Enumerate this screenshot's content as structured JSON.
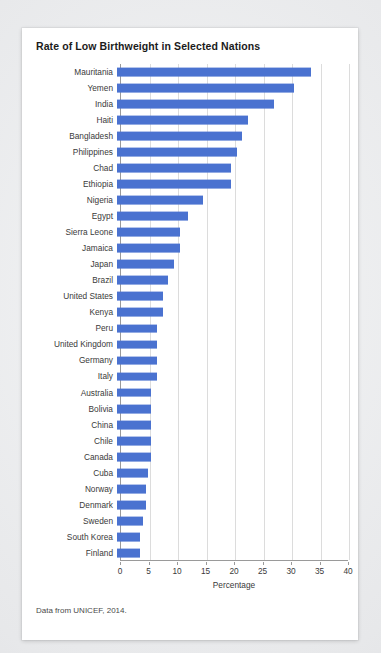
{
  "card": {
    "title": "Rate of Low Birthweight in Selected Nations",
    "source_note": "Data from UNICEF, 2014."
  },
  "chart_data": {
    "type": "bar",
    "orientation": "horizontal",
    "title": "Rate of Low Birthweight in Selected Nations",
    "xlabel": "Percentage",
    "ylabel": "",
    "xlim": [
      0,
      40
    ],
    "xticks": [
      0,
      5,
      10,
      15,
      20,
      25,
      30,
      35,
      40
    ],
    "grid": "vertical",
    "legend": "none",
    "bar_color": "#4a72d0",
    "categories": [
      "Mauritania",
      "Yemen",
      "India",
      "Haiti",
      "Bangladesh",
      "Philippines",
      "Chad",
      "Ethiopia",
      "Nigeria",
      "Egypt",
      "Sierra Leone",
      "Jamaica",
      "Japan",
      "Brazil",
      "United States",
      "Kenya",
      "Peru",
      "United Kingdom",
      "Germany",
      "Italy",
      "Australia",
      "Bolivia",
      "China",
      "Chile",
      "Canada",
      "Cuba",
      "Norway",
      "Denmark",
      "Sweden",
      "South Korea",
      "Finland"
    ],
    "values": [
      34,
      31,
      27.5,
      23,
      22,
      21,
      20,
      20,
      15,
      12.5,
      11,
      11,
      10,
      9,
      8,
      8,
      7,
      7,
      7,
      7,
      6,
      6,
      6,
      6,
      6,
      5.5,
      5,
      5,
      4.5,
      4,
      4
    ]
  }
}
